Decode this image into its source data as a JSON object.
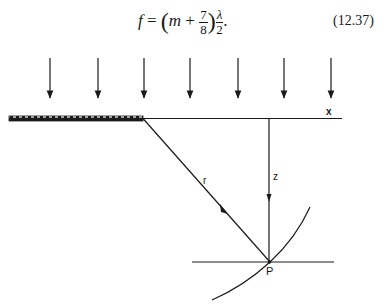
{
  "equation": {
    "lhs": "f",
    "equals": "=",
    "open_paren": "(",
    "m": "m",
    "plus": "+",
    "frac_num": "7",
    "frac_den": "8",
    "close_paren": ")",
    "lambda_num": "λ",
    "lambda_den": "2",
    "trailing": ".",
    "number": "(12.37)"
  },
  "diagram": {
    "incident_arrows_count": 7,
    "incident_arrow_x": [
      50,
      98,
      144,
      190,
      238,
      284,
      331
    ],
    "labels": {
      "x_axis": "x",
      "r": "r",
      "z": "z",
      "point": "P"
    },
    "colors": {
      "ink": "#1a1a1a",
      "background": "#ffffff"
    }
  }
}
